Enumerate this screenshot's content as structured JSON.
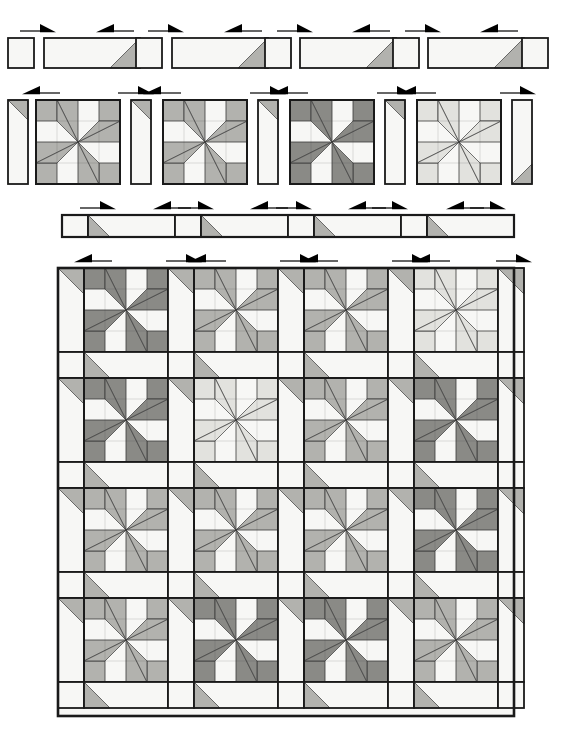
{
  "document": {
    "type": "quilt-assembly-diagram",
    "title": "Pinwheel Star Quilt Assembly Diagram",
    "width": 581,
    "height": 743,
    "background": "#ffffff"
  },
  "palette": {
    "white": "#f7f7f5",
    "light": "#e2e2de",
    "medium": "#b2b2ae",
    "dark": "#8a8a86",
    "outline": "#1a1a1a",
    "seam": "#3a3a3a",
    "arrow": "#000000"
  },
  "legend": {
    "fabric_values": [
      "white",
      "light",
      "medium",
      "dark"
    ],
    "fabric_labels": [
      "Background",
      "Light",
      "Medium",
      "Dark"
    ]
  },
  "steps": [
    {
      "id": "step-1",
      "name": "sashing-unit-row",
      "label": "Step 1 — sashing rectangles with corner triangles",
      "y": 38,
      "height": 30,
      "units": [
        {
          "kind": "square",
          "x": 8,
          "w": 26,
          "fabric": "white",
          "corner": "none"
        },
        {
          "kind": "strip",
          "x": 44,
          "w": 96,
          "fabric": "white",
          "corner": "br",
          "corner_fabric": "medium"
        },
        {
          "kind": "square",
          "x": 136,
          "w": 26,
          "fabric": "white",
          "corner": "none"
        },
        {
          "kind": "strip",
          "x": 172,
          "w": 96,
          "fabric": "white",
          "corner": "br",
          "corner_fabric": "medium"
        },
        {
          "kind": "square",
          "x": 265,
          "w": 26,
          "fabric": "white",
          "corner": "none"
        },
        {
          "kind": "strip",
          "x": 300,
          "w": 96,
          "fabric": "white",
          "corner": "br",
          "corner_fabric": "medium"
        },
        {
          "kind": "square",
          "x": 393,
          "w": 26,
          "fabric": "white",
          "corner": "none"
        },
        {
          "kind": "strip",
          "x": 428,
          "w": 96,
          "fabric": "white",
          "corner": "br",
          "corner_fabric": "medium"
        },
        {
          "kind": "square",
          "x": 522,
          "w": 26,
          "fabric": "white",
          "corner": "none"
        }
      ],
      "arrows": [
        {
          "x": 20,
          "y": 31,
          "dir": "right"
        },
        {
          "x": 98,
          "y": 31,
          "dir": "left"
        },
        {
          "x": 148,
          "y": 31,
          "dir": "right"
        },
        {
          "x": 226,
          "y": 31,
          "dir": "left"
        },
        {
          "x": 277,
          "y": 31,
          "dir": "right"
        },
        {
          "x": 354,
          "y": 31,
          "dir": "left"
        },
        {
          "x": 405,
          "y": 31,
          "dir": "right"
        },
        {
          "x": 482,
          "y": 31,
          "dir": "left"
        }
      ]
    },
    {
      "id": "step-2",
      "name": "block-and-sashing-row",
      "label": "Step 2 — blocks joined to vertical sashing strips",
      "y": 100,
      "height": 84,
      "sash_w": 20,
      "block_w": 84,
      "units": [
        {
          "kind": "vsash",
          "x": 8,
          "fabric": "white",
          "corner": "tr",
          "corner_fabric": "medium"
        },
        {
          "kind": "block",
          "x": 36,
          "block_index": 0
        },
        {
          "kind": "vsash",
          "x": 131,
          "fabric": "white",
          "corner": "tr",
          "corner_fabric": "medium"
        },
        {
          "kind": "block",
          "x": 163,
          "block_index": 1
        },
        {
          "kind": "vsash",
          "x": 258,
          "fabric": "white",
          "corner": "tr",
          "corner_fabric": "medium"
        },
        {
          "kind": "block",
          "x": 290,
          "block_index": 2
        },
        {
          "kind": "vsash",
          "x": 385,
          "fabric": "white",
          "corner": "tr",
          "corner_fabric": "medium"
        },
        {
          "kind": "block",
          "x": 417,
          "block_index": 3
        },
        {
          "kind": "vsash",
          "x": 512,
          "fabric": "white",
          "corner": "br",
          "corner_fabric": "medium"
        }
      ],
      "arrows": [
        {
          "x": 24,
          "y": 93,
          "dir": "left"
        },
        {
          "x": 118,
          "y": 93,
          "dir": "right"
        },
        {
          "x": 145,
          "y": 93,
          "dir": "left"
        },
        {
          "x": 250,
          "y": 93,
          "dir": "right"
        },
        {
          "x": 272,
          "y": 93,
          "dir": "left"
        },
        {
          "x": 377,
          "y": 93,
          "dir": "right"
        },
        {
          "x": 400,
          "y": 93,
          "dir": "left"
        },
        {
          "x": 500,
          "y": 93,
          "dir": "right"
        }
      ]
    },
    {
      "id": "step-3",
      "name": "long-sashing-row",
      "label": "Step 3 — pieced sashing row",
      "y": 215,
      "height": 22,
      "x": 62,
      "width": 452,
      "units": [
        {
          "kind": "square",
          "w": 26,
          "fabric": "white",
          "corner": "none"
        },
        {
          "kind": "strip",
          "w": 87,
          "fabric": "white",
          "corner": "bl",
          "corner_fabric": "medium"
        },
        {
          "kind": "square",
          "w": 26,
          "fabric": "white",
          "corner": "none"
        },
        {
          "kind": "strip",
          "w": 87,
          "fabric": "white",
          "corner": "bl",
          "corner_fabric": "medium"
        },
        {
          "kind": "square",
          "w": 26,
          "fabric": "white",
          "corner": "none"
        },
        {
          "kind": "strip",
          "w": 87,
          "fabric": "white",
          "corner": "bl",
          "corner_fabric": "medium"
        },
        {
          "kind": "square",
          "w": 26,
          "fabric": "white",
          "corner": "none"
        },
        {
          "kind": "strip",
          "w": 87,
          "fabric": "white",
          "corner": "bl",
          "corner_fabric": "medium"
        }
      ],
      "arrows": [
        {
          "x": 80,
          "y": 208,
          "dir": "right"
        },
        {
          "x": 155,
          "y": 208,
          "dir": "left"
        },
        {
          "x": 178,
          "y": 208,
          "dir": "right"
        },
        {
          "x": 252,
          "y": 208,
          "dir": "left"
        },
        {
          "x": 276,
          "y": 208,
          "dir": "right"
        },
        {
          "x": 350,
          "y": 208,
          "dir": "left"
        },
        {
          "x": 372,
          "y": 208,
          "dir": "right"
        },
        {
          "x": 448,
          "y": 208,
          "dir": "left"
        },
        {
          "x": 470,
          "y": 208,
          "dir": "right"
        }
      ]
    },
    {
      "id": "step-4",
      "name": "finished-quilt-top",
      "label": "Step 4 — finished quilt top, 4 x 4 block setting",
      "x": 58,
      "y": 268,
      "width": 456,
      "height": 448,
      "rows": 4,
      "cols": 4,
      "sash_w": 26,
      "block_w": 84,
      "arrows": [
        {
          "x": 76,
          "y": 261,
          "dir": "left"
        },
        {
          "x": 166,
          "y": 261,
          "dir": "right"
        },
        {
          "x": 190,
          "y": 261,
          "dir": "left"
        },
        {
          "x": 280,
          "y": 261,
          "dir": "right"
        },
        {
          "x": 302,
          "y": 261,
          "dir": "left"
        },
        {
          "x": 392,
          "y": 261,
          "dir": "right"
        },
        {
          "x": 414,
          "y": 261,
          "dir": "left"
        },
        {
          "x": 496,
          "y": 261,
          "dir": "right"
        }
      ]
    }
  ],
  "block_fabrics_row2": [
    "medium",
    "medium",
    "dark",
    "light"
  ],
  "quilt_grid_fabrics": [
    [
      "dark",
      "medium",
      "medium",
      "light"
    ],
    [
      "dark",
      "light",
      "medium",
      "dark"
    ],
    [
      "medium",
      "medium",
      "medium",
      "dark"
    ],
    [
      "medium",
      "dark",
      "dark",
      "medium"
    ]
  ],
  "block_geometry": {
    "description": "4x4 unit pinwheel star: four corner squares, four pinwheel parallelogram arms, four half-square-triangle units meeting at centre",
    "units_per_side": 4
  },
  "arrow_glyph": {
    "name": "press-direction-arrow",
    "shaft_len": 22,
    "head_len": 14,
    "head_h": 7
  }
}
